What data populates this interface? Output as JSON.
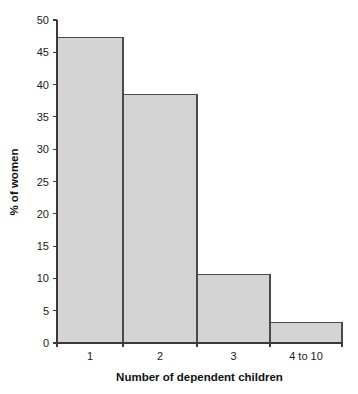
{
  "chart_data": {
    "type": "bar",
    "title": "",
    "subtitle": "",
    "categories": [
      "1",
      "2",
      "3",
      "4 to 10"
    ],
    "values": [
      47.3,
      38.5,
      10.6,
      3.2
    ],
    "xlabel": "Number of dependent children",
    "ylabel": "% of women",
    "ylim": [
      0,
      50
    ],
    "ytick_labels": [
      "0",
      "5",
      "10",
      "15",
      "20",
      "25",
      "30",
      "35",
      "40",
      "45",
      "50"
    ],
    "ytick_values": [
      0,
      5,
      10,
      15,
      20,
      25,
      30,
      35,
      40,
      45,
      50
    ],
    "xtick_labels": [
      "1",
      "2",
      "3",
      "4 to 10"
    ],
    "grid": false,
    "legend": null,
    "bar_style": "adjacent-histogram",
    "colors": {
      "bar_fill": "#d4d4d4",
      "bar_stroke": "#4a4a4a",
      "axis": "#3a3a3a",
      "text": "#1a1a1a",
      "background": "#ffffff"
    }
  },
  "figure": {
    "plot_left": 57,
    "plot_right": 342,
    "plot_top": 20,
    "plot_bottom": 343,
    "bar_edges": [
      57,
      123,
      197,
      270,
      342
    ]
  }
}
